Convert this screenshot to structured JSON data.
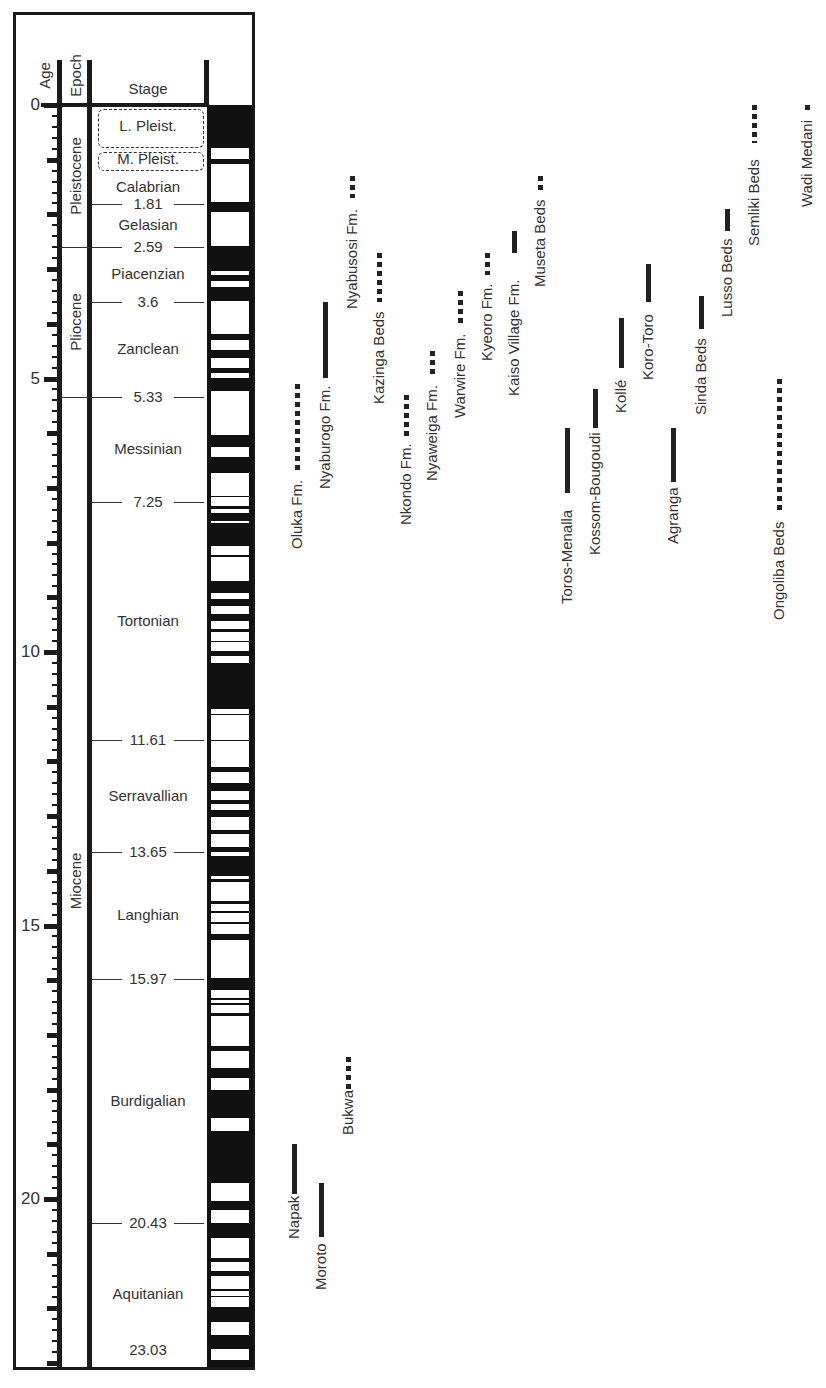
{
  "chart_data": {
    "type": "timeline",
    "title": "",
    "column_headers": {
      "age": "Age",
      "epoch": "Epoch",
      "stage": "Stage"
    },
    "age_axis": {
      "label": "Age",
      "unit": "Ma",
      "range": [
        0,
        23.03
      ],
      "tick_labels": [
        "0",
        "5",
        "10",
        "15",
        "20"
      ],
      "major_tick_every": 1,
      "minor_tick_every": 0.2
    },
    "epochs": [
      {
        "name": "Pleistocene",
        "start": 0,
        "end": 2.59
      },
      {
        "name": "Pliocene",
        "start": 2.59,
        "end": 5.33
      },
      {
        "name": "Miocene",
        "start": 5.33,
        "end": 23.03
      }
    ],
    "stages": [
      {
        "name": "L. Pleist.",
        "start": 0,
        "end": 0.78,
        "dashed": true
      },
      {
        "name": "M. Pleist.",
        "start": 0.78,
        "end": 1.2,
        "dashed": true
      },
      {
        "name": "Calabrian",
        "start": 1.2,
        "end": 1.81
      },
      {
        "name": "Gelasian",
        "start": 1.81,
        "end": 2.59
      },
      {
        "name": "Piacenzian",
        "start": 2.59,
        "end": 3.6
      },
      {
        "name": "Zanclean",
        "start": 3.6,
        "end": 5.33
      },
      {
        "name": "Messinian",
        "start": 5.33,
        "end": 7.25
      },
      {
        "name": "Tortonian",
        "start": 7.25,
        "end": 11.61
      },
      {
        "name": "Serravallian",
        "start": 11.61,
        "end": 13.65
      },
      {
        "name": "Langhian",
        "start": 13.65,
        "end": 15.97
      },
      {
        "name": "Burdigalian",
        "start": 15.97,
        "end": 20.43
      },
      {
        "name": "Aquitanian",
        "start": 20.43,
        "end": 23.03
      }
    ],
    "boundary_labels": [
      "1.81",
      "2.59",
      "3.6",
      "5.33",
      "7.25",
      "11.61",
      "13.65",
      "15.97",
      "20.43",
      "23.03"
    ],
    "polarity_normal_intervals": [
      [
        0.0,
        0.78
      ],
      [
        0.99,
        1.07
      ],
      [
        1.77,
        1.95
      ],
      [
        2.58,
        3.04
      ],
      [
        3.11,
        3.22
      ],
      [
        3.33,
        3.58
      ],
      [
        4.18,
        4.29
      ],
      [
        4.48,
        4.62
      ],
      [
        4.8,
        4.9
      ],
      [
        4.99,
        5.23
      ],
      [
        6.03,
        6.25
      ],
      [
        6.44,
        6.73
      ],
      [
        7.14,
        7.17
      ],
      [
        7.34,
        7.38
      ],
      [
        7.45,
        7.6
      ],
      [
        7.65,
        8.07
      ],
      [
        8.22,
        8.26
      ],
      [
        8.7,
        8.92
      ],
      [
        9.03,
        9.16
      ],
      [
        9.31,
        9.43
      ],
      [
        9.58,
        9.63
      ],
      [
        9.8,
        9.82
      ],
      [
        9.99,
        10.08
      ],
      [
        10.2,
        11.04
      ],
      [
        11.13,
        11.15
      ],
      [
        11.61,
        11.63
      ],
      [
        12.11,
        12.2
      ],
      [
        12.4,
        12.55
      ],
      [
        12.7,
        12.77
      ],
      [
        12.88,
        13.01
      ],
      [
        13.25,
        13.32
      ],
      [
        13.57,
        13.66
      ],
      [
        13.73,
        14.09
      ],
      [
        14.15,
        14.2
      ],
      [
        14.56,
        14.61
      ],
      [
        14.73,
        14.78
      ],
      [
        14.93,
        14.98
      ],
      [
        15.15,
        15.27
      ],
      [
        15.96,
        16.18
      ],
      [
        16.33,
        16.37
      ],
      [
        16.42,
        16.45
      ],
      [
        16.6,
        16.66
      ],
      [
        17.2,
        17.29
      ],
      [
        17.6,
        17.78
      ],
      [
        18.0,
        18.52
      ],
      [
        18.75,
        19.71
      ],
      [
        20.04,
        20.21
      ],
      [
        20.44,
        20.71
      ],
      [
        21.08,
        21.16
      ],
      [
        21.32,
        21.41
      ],
      [
        21.64,
        21.68
      ],
      [
        21.77,
        21.79
      ],
      [
        21.98,
        22.24
      ],
      [
        22.48,
        22.75
      ],
      [
        22.94,
        23.03
      ]
    ],
    "localities": [
      {
        "name": "Oluka Fm.",
        "start": 5.1,
        "end": 6.7,
        "style": "dotted"
      },
      {
        "name": "Nyaburogo Fm.",
        "start": 3.6,
        "end": 5.0,
        "style": "solid"
      },
      {
        "name": "Nyabusosi Fm.",
        "start": 1.3,
        "end": 1.7,
        "style": "dotted"
      },
      {
        "name": "Kazinga Beds",
        "start": 2.7,
        "end": 3.6,
        "style": "dotted"
      },
      {
        "name": "Nkondo Fm.",
        "start": 5.3,
        "end": 6.1,
        "style": "dotted"
      },
      {
        "name": "Nyaweiga Fm.",
        "start": 4.5,
        "end": 5.0,
        "style": "dotted"
      },
      {
        "name": "Warwire Fm.",
        "start": 3.4,
        "end": 4.0,
        "style": "dotted"
      },
      {
        "name": "Kyeoro Fm.",
        "start": 2.7,
        "end": 3.1,
        "style": "dotted"
      },
      {
        "name": "Kaiso Village Fm.",
        "start": 2.3,
        "end": 2.7,
        "style": "solid"
      },
      {
        "name": "Museta Beds",
        "start": 1.3,
        "end": 1.6,
        "style": "dotted"
      },
      {
        "name": "Toros-Menalla",
        "start": 5.9,
        "end": 7.1,
        "style": "solid"
      },
      {
        "name": "Kossom-Bougoudi",
        "start": 5.2,
        "end": 5.9,
        "style": "solid"
      },
      {
        "name": "Kollé",
        "start": 3.9,
        "end": 4.8,
        "style": "solid"
      },
      {
        "name": "Koro-Toro",
        "start": 2.9,
        "end": 3.6,
        "style": "solid"
      },
      {
        "name": "Agranga",
        "start": 5.9,
        "end": 6.9,
        "style": "solid"
      },
      {
        "name": "Sinda Beds",
        "start": 3.5,
        "end": 4.1,
        "style": "solid"
      },
      {
        "name": "Lusso Beds",
        "start": 1.9,
        "end": 2.3,
        "style": "solid"
      },
      {
        "name": "Semliki Beds",
        "start": 0.0,
        "end": 0.7,
        "style": "dotted"
      },
      {
        "name": "Wadi Medani",
        "start": 0.0,
        "end": 0.15,
        "style": "dotted"
      },
      {
        "name": "Ongoliba Beds",
        "start": 5.0,
        "end": 7.4,
        "style": "dotted"
      },
      {
        "name": "Napak",
        "start": 19.0,
        "end": 19.9,
        "style": "solid"
      },
      {
        "name": "Moroto",
        "start": 19.7,
        "end": 20.7,
        "style": "solid"
      },
      {
        "name": "Bukwa",
        "start": 17.4,
        "end": 18.0,
        "style": "dotted"
      }
    ]
  }
}
